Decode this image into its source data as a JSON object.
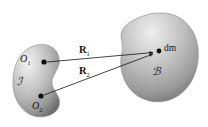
{
  "figure": {
    "caption": "Two rigid bodies with position vectors to a mass element",
    "background_color": "#ffffff",
    "ink_color": "#141414",
    "body_fill_light": "#e9e9e9",
    "body_fill_mid": "#b6b6b6",
    "body_fill_dark": "#6f6f6f",
    "width": 208,
    "height": 127
  },
  "bodies": [
    {
      "id": "body-j",
      "label": "ℐ",
      "label_name": "body-j-label",
      "label_x": 17,
      "label_y": 80,
      "role": "left body"
    },
    {
      "id": "body-b",
      "label": "ℬ",
      "label_name": "body-b-label",
      "label_x": 152,
      "label_y": 69,
      "role": "right body"
    }
  ],
  "points": [
    {
      "id": "origin-1",
      "label": "O",
      "subscript": "1",
      "x": 44,
      "y": 62,
      "label_x": 22,
      "label_y": 57
    },
    {
      "id": "origin-2",
      "label": "O",
      "subscript": "2",
      "x": 41,
      "y": 97,
      "label_x": 33,
      "label_y": 104
    },
    {
      "id": "mass-element",
      "label": "dm",
      "subscript": "",
      "x": 157,
      "y": 52,
      "label_x": 164,
      "label_y": 46
    }
  ],
  "vectors": [
    {
      "id": "vector-R1",
      "label": "R",
      "subscript": "1",
      "from": "origin-1",
      "to": "mass-element",
      "label_x": 80,
      "label_y": 50,
      "x1": 47,
      "y1": 62,
      "x2": 155,
      "y2": 52
    },
    {
      "id": "vector-R2",
      "label": "R",
      "subscript": "2",
      "from": "origin-2",
      "to": "mass-element",
      "label_x": 80,
      "label_y": 71,
      "x1": 44,
      "y1": 96,
      "x2": 155,
      "y2": 54
    }
  ]
}
